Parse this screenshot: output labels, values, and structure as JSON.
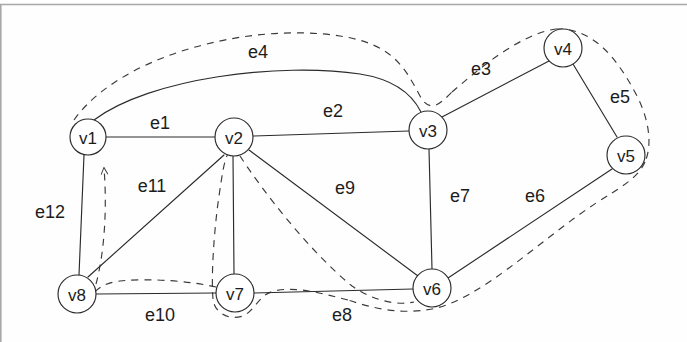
{
  "figure": {
    "kind": "undirected-graph-diagram",
    "background_color": "#fefefe",
    "ink_color": "#2b2b2b",
    "top_rule_color": "#a8a8a8",
    "width": 687,
    "height": 342
  },
  "nodes": [
    {
      "id": "v1",
      "label": "v1",
      "cx": 88,
      "cy": 137,
      "r": 18
    },
    {
      "id": "v2",
      "label": "v2",
      "cx": 234,
      "cy": 137,
      "r": 19
    },
    {
      "id": "v3",
      "label": "v3",
      "cx": 428,
      "cy": 130,
      "r": 19
    },
    {
      "id": "v4",
      "label": "v4",
      "cx": 563,
      "cy": 48,
      "r": 19
    },
    {
      "id": "v5",
      "label": "v5",
      "cx": 626,
      "cy": 155,
      "r": 19
    },
    {
      "id": "v6",
      "label": "v6",
      "cx": 432,
      "cy": 288,
      "r": 19
    },
    {
      "id": "v7",
      "label": "v7",
      "cx": 235,
      "cy": 293,
      "r": 19
    },
    {
      "id": "v8",
      "label": "v8",
      "cx": 77,
      "cy": 294,
      "r": 19
    }
  ],
  "edges": [
    {
      "id": "e1",
      "label": "e1",
      "from": "v1",
      "to": "v2",
      "shape": "straight",
      "label_x": 160,
      "label_y": 123
    },
    {
      "id": "e2",
      "label": "e2",
      "from": "v2",
      "to": "v3",
      "shape": "straight",
      "label_x": 333,
      "label_y": 111
    },
    {
      "id": "e3",
      "label": "e3",
      "from": "v3",
      "to": "v4",
      "shape": "straight",
      "label_x": 481,
      "label_y": 69
    },
    {
      "id": "e4",
      "label": "e4",
      "from": "v1",
      "to": "v3",
      "shape": "arc",
      "label_x": 258,
      "label_y": 52
    },
    {
      "id": "e5",
      "label": "e5",
      "from": "v4",
      "to": "v5",
      "shape": "straight",
      "label_x": 620,
      "label_y": 97
    },
    {
      "id": "e6",
      "label": "e6",
      "from": "v6",
      "to": "v5",
      "shape": "straight",
      "label_x": 535,
      "label_y": 196
    },
    {
      "id": "e7",
      "label": "e7",
      "from": "v3",
      "to": "v6",
      "shape": "straight",
      "label_x": 460,
      "label_y": 196
    },
    {
      "id": "e8",
      "label": "e8",
      "from": "v7",
      "to": "v6",
      "shape": "straight",
      "label_x": 342,
      "label_y": 315
    },
    {
      "id": "e9",
      "label": "e9",
      "from": "v2",
      "to": "v6",
      "shape": "straight",
      "label_x": 345,
      "label_y": 188
    },
    {
      "id": "e10",
      "label": "e10",
      "from": "v8",
      "to": "v7",
      "shape": "straight",
      "label_x": 160,
      "label_y": 315
    },
    {
      "id": "e11",
      "label": "e11",
      "from": "v2",
      "to": "v8",
      "shape": "straight",
      "label_x": 152,
      "label_y": 186
    },
    {
      "id": "e12",
      "label": "e12",
      "from": "v1",
      "to": "v8",
      "shape": "straight",
      "label_x": 50,
      "label_y": 212
    }
  ],
  "tour": {
    "style": "dashed",
    "has_arrowhead": true,
    "arrow_target": "v1",
    "visits": [
      "v1",
      "v3",
      "v4",
      "v5",
      "v6",
      "v7",
      "v2",
      "v8",
      "v1"
    ]
  }
}
